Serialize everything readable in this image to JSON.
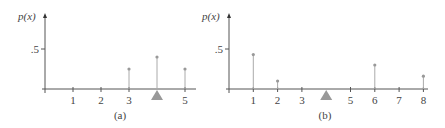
{
  "chart_data": [
    {
      "type": "stem",
      "panel_label": "(a)",
      "ylabel": "p(x)",
      "yticks": [
        {
          "value": 0.5,
          "label": ".5"
        }
      ],
      "xticks": [
        1,
        2,
        3,
        5
      ],
      "xtick_labels": [
        "1",
        "2",
        "3",
        "5"
      ],
      "x": [
        3,
        4,
        5
      ],
      "values": [
        0.25,
        0.4,
        0.25
      ],
      "fulcrum_at": 4,
      "xlim": [
        0,
        5.4
      ],
      "ylim": [
        0,
        1
      ]
    },
    {
      "type": "stem",
      "panel_label": "(b)",
      "ylabel": "p(x)",
      "yticks": [
        {
          "value": 0.5,
          "label": ".5"
        }
      ],
      "xticks": [
        1,
        2,
        3,
        5,
        6,
        7,
        8
      ],
      "xtick_labels": [
        "1",
        "2",
        "3",
        "5",
        "6",
        "7",
        "8"
      ],
      "x": [
        1,
        2,
        6,
        8
      ],
      "values": [
        0.43,
        0.1,
        0.3,
        0.16
      ],
      "fulcrum_at": 4,
      "xlim": [
        0,
        8.3
      ],
      "ylim": [
        0,
        1
      ]
    }
  ]
}
